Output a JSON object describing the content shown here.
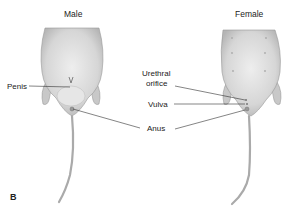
{
  "figure": {
    "panel_label": "B",
    "male": {
      "title": "Male",
      "labels": {
        "penis": "Penis",
        "anus": "Anus"
      }
    },
    "female": {
      "title": "Female",
      "labels": {
        "urethral_orifice_1": "Urethral",
        "urethral_orifice_2": "orifice",
        "vulva": "Vulva"
      }
    },
    "colors": {
      "body": "#d9d9d9",
      "body_shade": "#b8b8b8",
      "line": "#333333",
      "text": "#222222"
    }
  }
}
